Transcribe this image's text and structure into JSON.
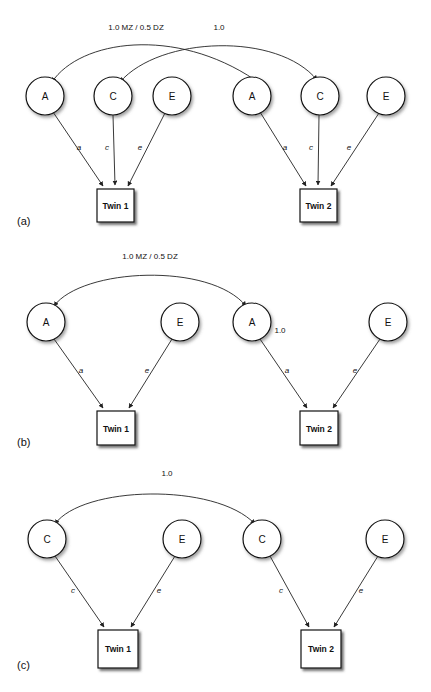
{
  "figure": {
    "background": "#ffffff",
    "stroke": "#222222",
    "panels": [
      {
        "id": "a",
        "label": "(a)",
        "model_name": "ACE",
        "correlations": [
          {
            "name": "A-correlation",
            "label": "1.0 MZ / 0.5 DZ"
          },
          {
            "name": "C-correlation",
            "label": "1.0"
          }
        ],
        "latent_nodes": [
          {
            "label": "A",
            "side": "left"
          },
          {
            "label": "C",
            "side": "left"
          },
          {
            "label": "E",
            "side": "left"
          },
          {
            "label": "A",
            "side": "right"
          },
          {
            "label": "C",
            "side": "right"
          },
          {
            "label": "E",
            "side": "right"
          }
        ],
        "path_coefficients": [
          "a",
          "c",
          "e",
          "a",
          "c",
          "e"
        ],
        "observed_nodes": [
          {
            "label": "Twin 1"
          },
          {
            "label": "Twin 2"
          }
        ]
      },
      {
        "id": "b",
        "label": "(b)",
        "model_name": "AE",
        "correlations": [
          {
            "name": "A-correlation",
            "label": "1.0 MZ / 0.5 DZ"
          },
          {
            "name": "A-inline-value",
            "label": "1.0"
          }
        ],
        "latent_nodes": [
          {
            "label": "A",
            "side": "left"
          },
          {
            "label": "E",
            "side": "left"
          },
          {
            "label": "A",
            "side": "right"
          },
          {
            "label": "E",
            "side": "right"
          }
        ],
        "path_coefficients": [
          "a",
          "e",
          "a",
          "e"
        ],
        "observed_nodes": [
          {
            "label": "Twin 1"
          },
          {
            "label": "Twin 2"
          }
        ]
      },
      {
        "id": "c",
        "label": "(c)",
        "model_name": "CE",
        "correlations": [
          {
            "name": "C-correlation",
            "label": "1.0"
          }
        ],
        "latent_nodes": [
          {
            "label": "C",
            "side": "left"
          },
          {
            "label": "E",
            "side": "left"
          },
          {
            "label": "C",
            "side": "right"
          },
          {
            "label": "E",
            "side": "right"
          }
        ],
        "path_coefficients": [
          "c",
          "e",
          "c",
          "e"
        ],
        "observed_nodes": [
          {
            "label": "Twin 1"
          },
          {
            "label": "Twin 2"
          }
        ]
      }
    ]
  }
}
